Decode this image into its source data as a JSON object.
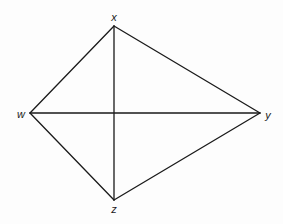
{
  "diagram": {
    "type": "quadrilateral-with-diagonals",
    "shape": "kite",
    "stroke_color": "#1a1a1a",
    "background_color": "#fdfdfd",
    "vertices": [
      {
        "id": "x",
        "label": "x",
        "cx": 114,
        "cy": 26,
        "lx": 114,
        "ly": 17
      },
      {
        "id": "w",
        "label": "w",
        "cx": 30,
        "cy": 113,
        "lx": 21,
        "ly": 114
      },
      {
        "id": "y",
        "label": "y",
        "cx": 260,
        "cy": 113,
        "lx": 268,
        "ly": 115
      },
      {
        "id": "z",
        "label": "z",
        "cx": 114,
        "cy": 200,
        "lx": 114,
        "ly": 209
      }
    ],
    "sides": [
      {
        "from": "w",
        "to": "x"
      },
      {
        "from": "x",
        "to": "y"
      },
      {
        "from": "y",
        "to": "z"
      },
      {
        "from": "z",
        "to": "w"
      }
    ],
    "diagonals": [
      {
        "from": "x",
        "to": "z"
      },
      {
        "from": "w",
        "to": "y"
      }
    ]
  }
}
